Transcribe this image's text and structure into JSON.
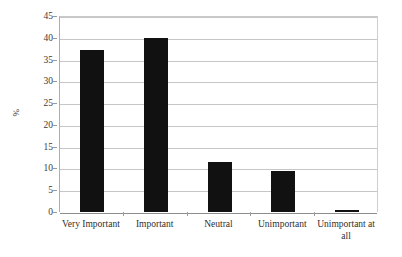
{
  "chart_data": {
    "type": "bar",
    "title": "",
    "subtitle": "",
    "xlabel": "",
    "ylabel": "%",
    "categories": [
      "Very Important",
      "Important",
      "Neutral",
      "Unimportant",
      "Unimportant at all"
    ],
    "values": [
      37.2,
      40.0,
      11.4,
      9.5,
      0.4
    ],
    "series": [
      {
        "name": "",
        "values": [
          37.2,
          40.0,
          11.4,
          9.5,
          0.4
        ]
      }
    ],
    "ylim": [
      0,
      45
    ],
    "ytick_step": 5,
    "ytick_labels": [
      "0",
      "5",
      "10",
      "15",
      "20",
      "25",
      "30",
      "35",
      "40",
      "45"
    ],
    "ytick_values": [
      0,
      5,
      10,
      15,
      20,
      25,
      30,
      35,
      40,
      45
    ],
    "grid": "horizontal",
    "legend": "none",
    "legend_position": "none",
    "bar_color": "#111111",
    "gridline_color": "#c6c6c6",
    "axis_color": "#8e8e8e",
    "background_color": "#ffffff",
    "annotations": []
  },
  "axes": {
    "y_label_text": "%",
    "x_label_lines": [
      [
        "Very Important"
      ],
      [
        "Important"
      ],
      [
        "Neutral"
      ],
      [
        "Unimportant"
      ],
      [
        "Unimportant at",
        "all"
      ]
    ]
  }
}
